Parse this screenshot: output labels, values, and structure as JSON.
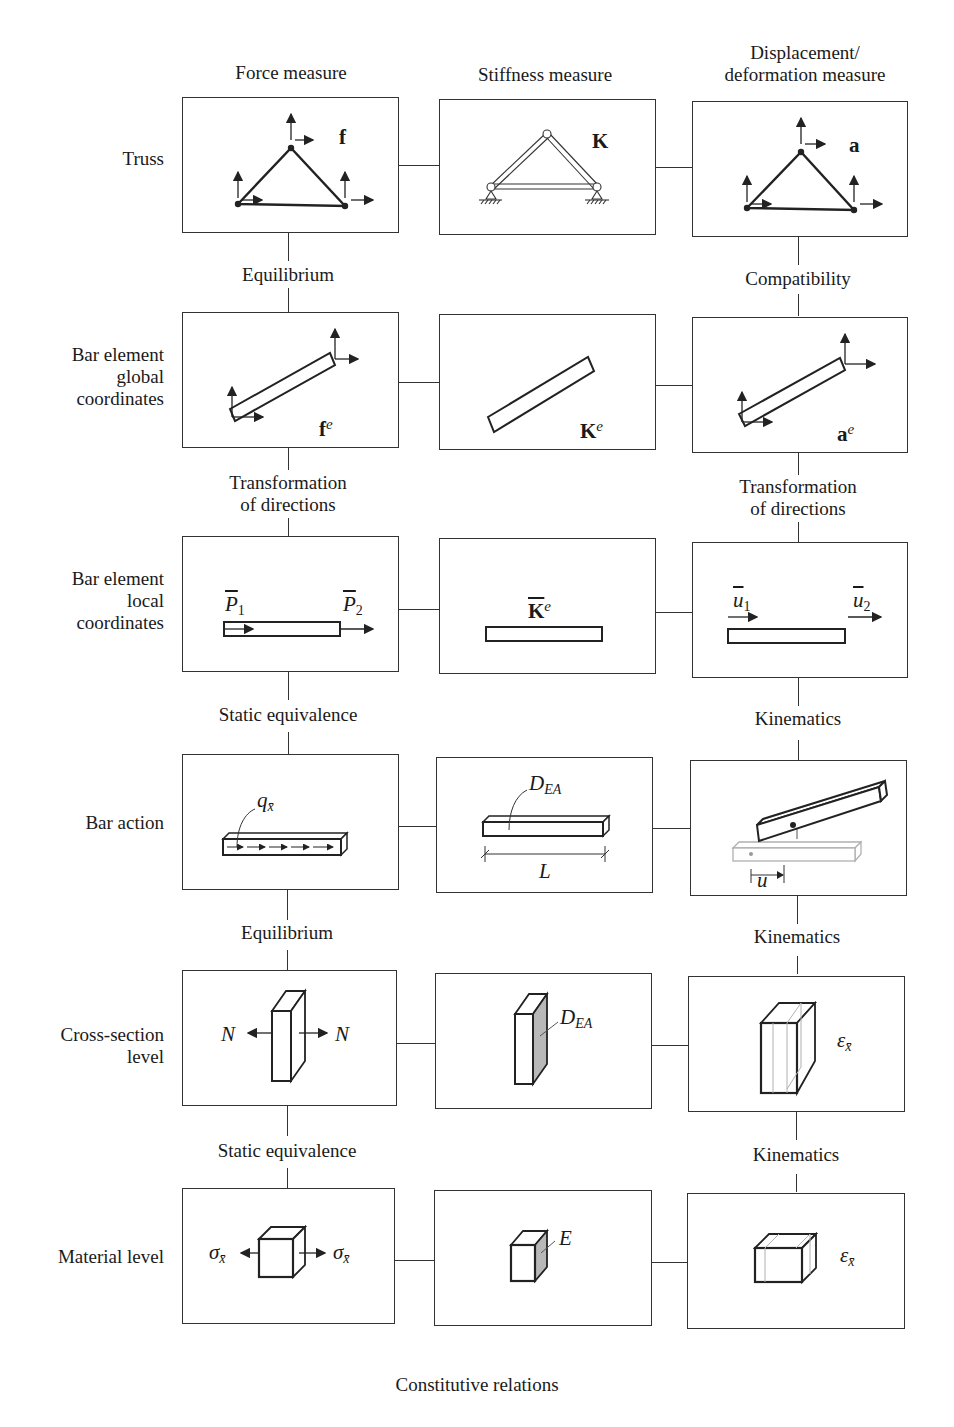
{
  "columns": [
    {
      "id": "force",
      "header": "Force measure"
    },
    {
      "id": "stiffness",
      "header": "Stiffness measure"
    },
    {
      "id": "displacement",
      "header": "Displacement/\ndeformation measure"
    }
  ],
  "rows": [
    {
      "id": "truss",
      "label": "Truss",
      "symbols": {
        "force": "f",
        "stiffness": "K",
        "displacement": "a"
      }
    },
    {
      "id": "bar-global",
      "label": "Bar element\nglobal\ncoordinates",
      "symbols": {
        "force": "f",
        "force_sup": "e",
        "stiffness": "K",
        "stiffness_sup": "e",
        "displacement": "a",
        "displacement_sup": "e"
      }
    },
    {
      "id": "bar-local",
      "label": "Bar element\nlocal\ncoordinates",
      "symbols": {
        "force_1": "P",
        "force_1_sub": "1",
        "force_2": "P",
        "force_2_sub": "2",
        "stiffness": "K",
        "stiffness_sup": "e",
        "displacement_1": "u",
        "displacement_1_sub": "1",
        "displacement_2": "u",
        "displacement_2_sub": "2"
      }
    },
    {
      "id": "bar-action",
      "label": "Bar action",
      "symbols": {
        "force": "q",
        "force_sub": "x̄",
        "stiffness": "D",
        "stiffness_sub": "EA",
        "length": "L",
        "displacement": "u"
      }
    },
    {
      "id": "cross-section",
      "label": "Cross-section\nlevel",
      "symbols": {
        "force_left": "N",
        "force_right": "N",
        "stiffness": "D",
        "stiffness_sub": "EA",
        "displacement": "ε",
        "displacement_sub": "x̄"
      }
    },
    {
      "id": "material",
      "label": "Material level",
      "symbols": {
        "force_left": "σ",
        "force_left_sub": "x̄",
        "force_right": "σ",
        "force_right_sub": "x̄",
        "stiffness": "E",
        "displacement": "ε",
        "displacement_sub": "x̄"
      }
    }
  ],
  "relations": {
    "force": [
      "Equilibrium",
      "Transformation\nof directions",
      "Static equivalence",
      "Equilibrium",
      "Static equivalence"
    ],
    "displacement": [
      "Compatibility",
      "Transformation\nof directions",
      "Kinematics",
      "Kinematics",
      "Kinematics"
    ]
  },
  "footer": "Constitutive relations",
  "colors": {
    "line": "#333333",
    "shade": "#b8b8b8",
    "ghost": "#b0b0b0"
  }
}
